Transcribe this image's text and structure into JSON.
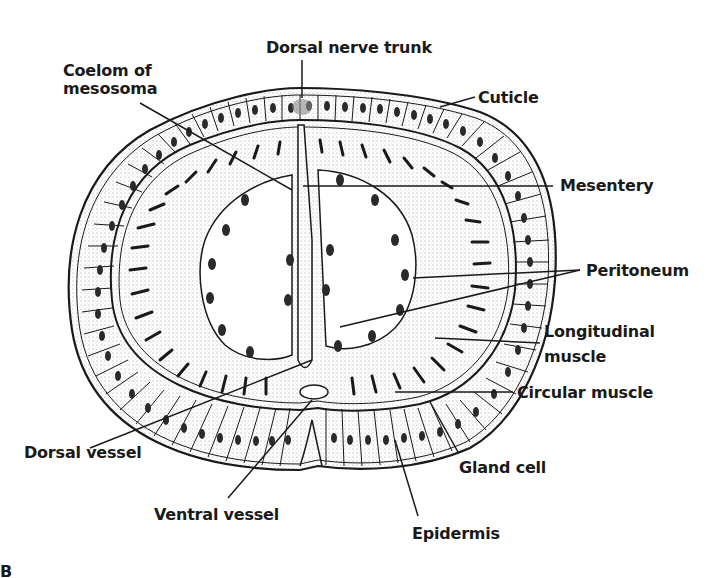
{
  "diagram": {
    "labels": {
      "dorsal_nerve_trunk": "Dorsal nerve trunk",
      "coelom_of_mesosoma_line1": "Coelom of",
      "coelom_of_mesosoma_line2": "mesosoma",
      "cuticle": "Cuticle",
      "mesentery": "Mesentery",
      "peritoneum": "Peritoneum",
      "longitudinal_muscle_line1": "Longitudinal",
      "longitudinal_muscle_line2": "muscle",
      "circular_muscle": "Circular muscle",
      "dorsal_vessel": "Dorsal vessel",
      "gland_cell": "Gland cell",
      "ventral_vessel": "Ventral vessel",
      "epidermis": "Epidermis"
    },
    "panel_letter": "B",
    "colors": {
      "ink": "#1a1a1a",
      "background": "#ffffff",
      "stipple": "#d8d8d8"
    }
  }
}
